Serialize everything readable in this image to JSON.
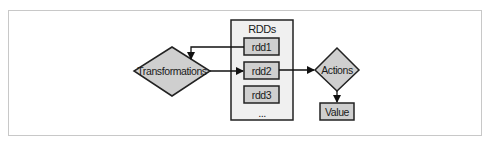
{
  "diagram": {
    "container": {
      "label": "RDDs",
      "ellipsis": "..."
    },
    "rdds": [
      {
        "label": "rdd1"
      },
      {
        "label": "rdd2"
      },
      {
        "label": "rdd3"
      }
    ],
    "nodes": {
      "transformations": {
        "label": "Transformations",
        "shape": "diamond"
      },
      "actions": {
        "label": "Actions",
        "shape": "diamond"
      },
      "value": {
        "label": "Value",
        "shape": "box"
      }
    },
    "edges": [
      {
        "from": "rdd1",
        "to": "transformations"
      },
      {
        "from": "transformations",
        "to": "rdd2"
      },
      {
        "from": "rdd2",
        "to": "actions"
      },
      {
        "from": "actions",
        "to": "value"
      }
    ],
    "colors": {
      "node_fill": "#cfcfcf",
      "container_fill": "#f0f0f0",
      "stroke": "#222222",
      "frame": "#c8c8c8"
    }
  }
}
